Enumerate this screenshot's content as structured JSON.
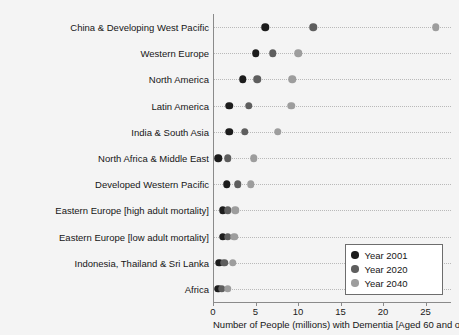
{
  "chart_data": {
    "type": "scatter",
    "title": "",
    "subtitle": "",
    "xlabel": "Number of People (millions) with Dementia [Aged 60 and over]",
    "ylabel": "",
    "xlim": [
      0,
      28
    ],
    "ylim": [
      0,
      11
    ],
    "grid": true,
    "grid_style": "dotted-horizontal",
    "legend_position": "bottom-right",
    "xticks": [
      0,
      5,
      10,
      15,
      20,
      25
    ],
    "xtick_labels": [
      "0",
      "5",
      "10",
      "15",
      "20",
      "25"
    ],
    "categories": [
      "China & Developing West Pacific",
      "Western Europe",
      "North America",
      "Latin America",
      "India & South Asia",
      "North Africa & Middle East",
      "Developed Western Pacific",
      "Eastern Europe [high adult mortality]",
      "Eastern Europe [low adult mortality]",
      "Indonesia, Thailand & Sri Lanka",
      "Africa"
    ],
    "series": [
      {
        "name": "Year 2001",
        "color": "#1c1c1c",
        "values": [
          6.0,
          4.9,
          3.4,
          1.8,
          1.8,
          0.5,
          1.5,
          1.0,
          1.0,
          0.6,
          0.5
        ]
      },
      {
        "name": "Year 2020",
        "color": "#5e5e5e",
        "values": [
          11.7,
          6.9,
          5.1,
          4.1,
          3.6,
          1.6,
          2.8,
          1.6,
          1.6,
          1.2,
          0.9
        ]
      },
      {
        "name": "Year 2040",
        "color": "#9d9d9d",
        "values": [
          26.1,
          9.9,
          9.2,
          9.1,
          7.5,
          4.7,
          4.3,
          2.5,
          2.4,
          2.2,
          1.6
        ]
      }
    ]
  },
  "legend": {
    "entries": [
      {
        "label": "Year 2001",
        "color": "#1c1c1c"
      },
      {
        "label": "Year 2020",
        "color": "#5e5e5e"
      },
      {
        "label": "Year 2040",
        "color": "#9d9d9d"
      }
    ]
  }
}
